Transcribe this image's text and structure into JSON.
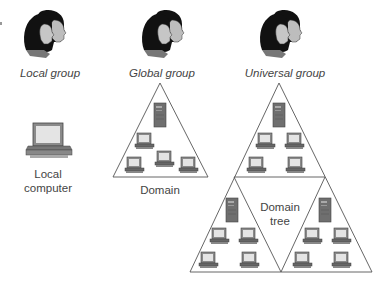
{
  "groups": [
    {
      "id": "local",
      "label": "Local group"
    },
    {
      "id": "global",
      "label": "Global group"
    },
    {
      "id": "universal",
      "label": "Universal group"
    }
  ],
  "local_computer": {
    "label_line1": "Local",
    "label_line2": "computer"
  },
  "domain": {
    "label": "Domain"
  },
  "domain_tree": {
    "label_line1": "Domain",
    "label_line2": "tree"
  },
  "icons": {
    "group": "people-heads-icon",
    "computer": "desktop-computer-icon",
    "server": "server-tower-icon",
    "workstation": "workstation-icon"
  },
  "colors": {
    "line": "#555555",
    "hair": "#111111",
    "skin": "#bdbdbd",
    "server": "#6f6f6f",
    "screen": "#e4e4e4",
    "monitor": "#8a8a8a"
  }
}
